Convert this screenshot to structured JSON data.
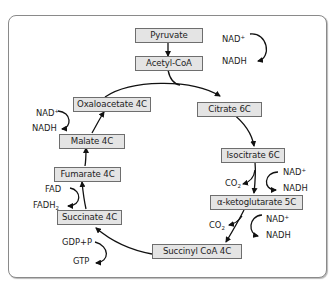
{
  "diagram": {
    "nodes": {
      "pyruvate": "Pyruvate",
      "acetyl_coa": "Acetyl-CoA",
      "citrate": "Citrate 6C",
      "isocitrate": "Isocitrate 6C",
      "alpha_ketoglutarate": "α-ketoglutarate 5C",
      "succinyl_coa": "Succinyl CoA 4C",
      "succinate": "Succinate 4C",
      "fumarate": "Fumarate 4C",
      "malate": "Malate 4C",
      "oxaloacetate": "Oxaloacetate 4C"
    },
    "side_reactions": {
      "pyruvate_step": {
        "in": "NAD",
        "in_sup": "+",
        "out": "NADH"
      },
      "isocitrate_step": {
        "in": "NAD",
        "in_sup": "+",
        "out": "NADH",
        "byproduct": "CO",
        "byproduct_sub": "2"
      },
      "ketoglutarate_step": {
        "in": "NAD",
        "in_sup": "+",
        "out": "NADH",
        "byproduct": "CO",
        "byproduct_sub": "2"
      },
      "succinyl_step": {
        "in": "GDP+P",
        "out": "GTP"
      },
      "succinate_step": {
        "in": "FAD",
        "out": "FADH",
        "out_sub": "2"
      },
      "malate_step": {
        "in": "NAD",
        "in_sup": "+",
        "out": "NADH"
      }
    }
  }
}
